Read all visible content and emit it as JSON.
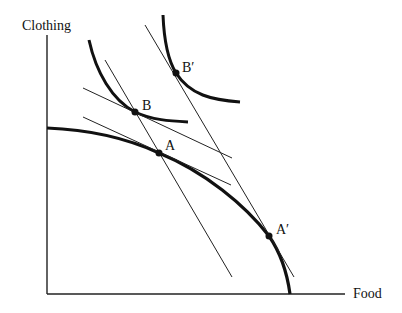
{
  "diagram": {
    "type": "economics-ppf-indifference",
    "axes": {
      "y_label": "Clothing",
      "x_label": "Food"
    },
    "points": [
      {
        "id": "A",
        "label": "A",
        "x": 159,
        "y": 153
      },
      {
        "id": "B",
        "label": "B",
        "x": 135,
        "y": 112
      },
      {
        "id": "A_prime",
        "label": "A′",
        "x": 269,
        "y": 236
      },
      {
        "id": "B_prime",
        "label": "B′",
        "x": 176,
        "y": 73
      }
    ],
    "curves": [
      {
        "id": "production-possibility-frontier",
        "description": "bowed-out curve through A and A′"
      },
      {
        "id": "indifference-curve-low",
        "description": "convex curve tangent at B"
      },
      {
        "id": "indifference-curve-high",
        "description": "convex curve tangent at B′"
      }
    ],
    "lines": [
      {
        "id": "price-line-steep-AB",
        "description": "steep line through B and A"
      },
      {
        "id": "price-line-shallow-B",
        "description": "shallow tangent line at B"
      },
      {
        "id": "price-line-shallow-A",
        "description": "shallow tangent line at A"
      },
      {
        "id": "price-line-steep-B-prime-A-prime",
        "description": "steep line through B′ and A′"
      }
    ],
    "colors": {
      "ink": "#111111",
      "background": "#ffffff"
    }
  }
}
